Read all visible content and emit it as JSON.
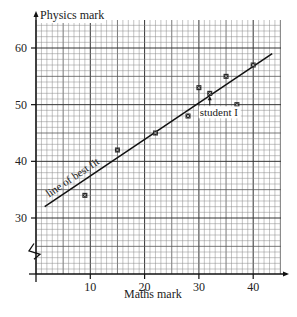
{
  "chart_data": {
    "type": "scatter",
    "title": "",
    "xlabel": "Maths mark",
    "ylabel": "Physics mark",
    "xlim": [
      0,
      44.5
    ],
    "ylim": [
      22,
      64
    ],
    "x_ticks": [
      "10",
      "20",
      "30",
      "40"
    ],
    "y_ticks": [
      "30",
      "40",
      "50",
      "60"
    ],
    "grid": true,
    "y_axis_break": true,
    "series": [
      {
        "name": "students",
        "points": [
          {
            "x": 9,
            "y": 34
          },
          {
            "x": 15,
            "y": 42
          },
          {
            "x": 22,
            "y": 45
          },
          {
            "x": 28,
            "y": 48
          },
          {
            "x": 30,
            "y": 53
          },
          {
            "x": 32,
            "y": 52
          },
          {
            "x": 35,
            "y": 55
          },
          {
            "x": 37,
            "y": 50
          },
          {
            "x": 40,
            "y": 57
          }
        ]
      }
    ],
    "best_fit_line": {
      "label": "line of best fit",
      "x1": 1.6,
      "y1": 32,
      "x2": 43.5,
      "y2": 59
    },
    "annotations": [
      {
        "text": "student I",
        "x": 32,
        "y": 52
      }
    ]
  }
}
